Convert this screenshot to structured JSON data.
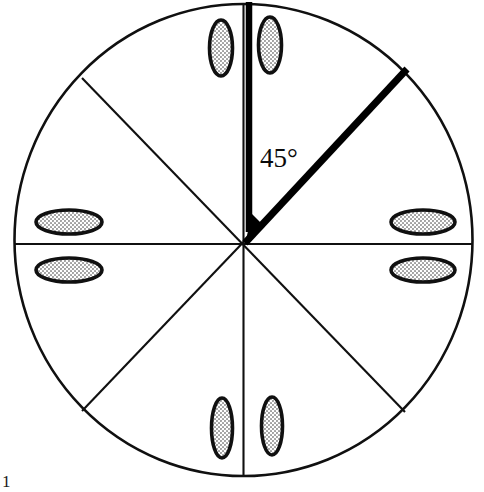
{
  "figure": {
    "angle_label": "45°",
    "corner_mark": "1",
    "colors": {
      "stroke": "#101010",
      "background": "#ffffff",
      "ellipse_fill": "#b9b9b9",
      "ellipse_outline": "#101010",
      "highlight": "#000000"
    },
    "circle": {
      "center_x": 243.5,
      "center_y": 240,
      "radius_x": 229,
      "radius_y": 236,
      "stroke_width": 2.4
    },
    "sector_count": 8,
    "sector_degrees": 45,
    "divider_angles_deg": [
      0,
      45,
      90,
      135
    ],
    "highlight": {
      "arm_vertical_deg": 90,
      "arm_diagonal_deg": 45,
      "stroke_width": 7
    },
    "ellipses": [
      {
        "id": "top-left-of-vertical",
        "cx": 221,
        "cy": 48,
        "rx": 11.5,
        "ry": 28,
        "rotate": 0,
        "sector": "north-west-of-vertical"
      },
      {
        "id": "top-right-of-vertical",
        "cx": 270,
        "cy": 45,
        "rx": 11.5,
        "ry": 28,
        "rotate": 0,
        "sector": "north-east-of-vertical"
      },
      {
        "id": "left-upper",
        "cx": 69,
        "cy": 222,
        "rx": 33,
        "ry": 12,
        "rotate": 0,
        "sector": "west-upper"
      },
      {
        "id": "left-lower",
        "cx": 69,
        "cy": 270,
        "rx": 33,
        "ry": 12,
        "rotate": 0,
        "sector": "west-lower"
      },
      {
        "id": "right-upper",
        "cx": 423,
        "cy": 222,
        "rx": 32,
        "ry": 12,
        "rotate": 0,
        "sector": "east-upper"
      },
      {
        "id": "right-lower",
        "cx": 423,
        "cy": 270,
        "rx": 32,
        "ry": 12,
        "rotate": 0,
        "sector": "east-lower"
      },
      {
        "id": "bottom-left-of-vertical",
        "cx": 222,
        "cy": 428,
        "rx": 10.5,
        "ry": 30,
        "rotate": 0,
        "sector": "south-west-of-vertical"
      },
      {
        "id": "bottom-right-of-vertical",
        "cx": 272,
        "cy": 426,
        "rx": 10.5,
        "ry": 29,
        "rotate": 0,
        "sector": "south-east-of-vertical"
      }
    ]
  }
}
